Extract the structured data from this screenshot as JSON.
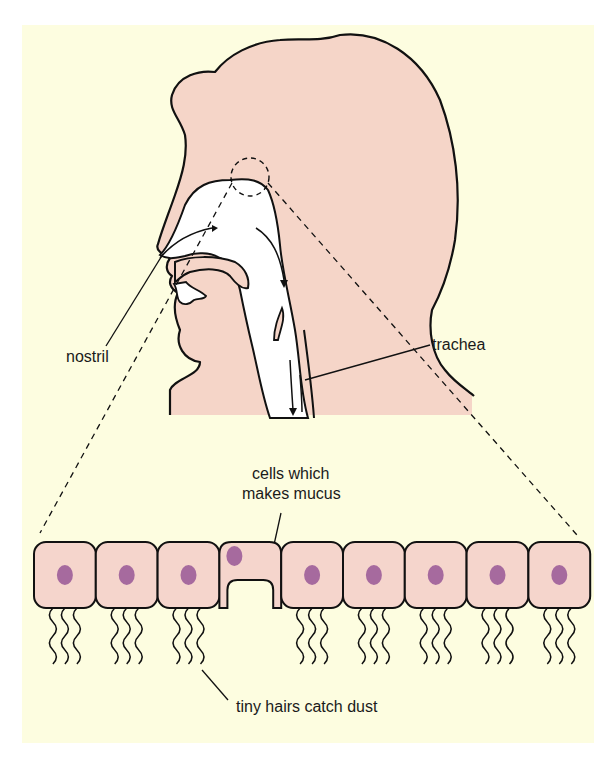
{
  "diagram": {
    "type": "labeled anatomical illustration",
    "colors": {
      "background_panel": "#fdfde0",
      "skin": "#f5d5c8",
      "airway": "#ffffff",
      "cell_fill": "#f5d5cc",
      "nucleus": "#a66a9e",
      "outline": "#111111"
    },
    "labels": {
      "nostril": "nostril",
      "trachea": "trachea",
      "mucus_line1": "cells which",
      "mucus_line2": "makes mucus",
      "hairs": "tiny hairs catch dust"
    },
    "cells": {
      "count": 9,
      "mucus_cell_index": 3
    }
  }
}
